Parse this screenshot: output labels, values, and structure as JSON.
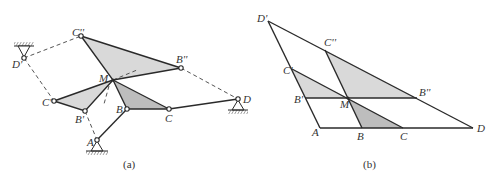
{
  "figure_a": {
    "caption": "(a)",
    "labels": {
      "A": "A",
      "B": "B",
      "C": "C",
      "D": "D",
      "B1": "B'",
      "C1": "C'",
      "D1": "D'",
      "B2": "B''",
      "C2": "C''",
      "M": "M"
    }
  },
  "figure_b": {
    "caption": "(b)",
    "labels": {
      "A": "A",
      "B": "B",
      "C": "C",
      "D": "D",
      "B1": "B'",
      "C1": "C'",
      "D1": "D'",
      "B2": "B''",
      "C2": "C''",
      "M": "M"
    }
  },
  "colors": {
    "light_fill": "#d9d9d9",
    "dark_fill": "#bdbdbd",
    "line": "#2a2a2a"
  }
}
